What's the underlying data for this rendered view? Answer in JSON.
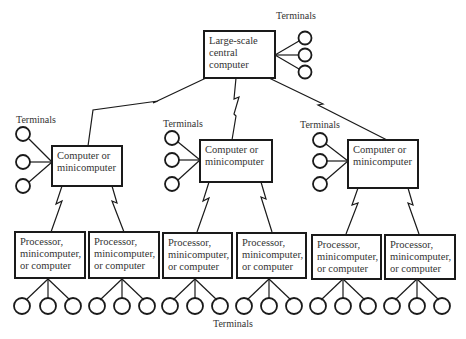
{
  "diagram": {
    "type": "hierarchical distributed processing network",
    "root": {
      "lines": [
        "Large-scale",
        "central",
        "computer"
      ],
      "terminals_label": "Terminals",
      "terminal_count": 3
    },
    "middle": [
      {
        "lines": [
          "Computer or",
          "minicomputer"
        ],
        "terminals_label": "Terminals",
        "terminal_count": 3
      },
      {
        "lines": [
          "Computer or",
          "minicomputer"
        ],
        "terminals_label": "Terminals",
        "terminal_count": 3
      },
      {
        "lines": [
          "Computer or",
          "minicomputer"
        ],
        "terminals_label": "Terminals",
        "terminal_count": 3
      }
    ],
    "leaves": [
      {
        "lines": [
          "Processor,",
          "minicomputer,",
          "or computer"
        ],
        "terminal_count": 3
      },
      {
        "lines": [
          "Processor,",
          "minicomputer,",
          "or computer"
        ],
        "terminal_count": 3
      },
      {
        "lines": [
          "Processor,",
          "minicomputer,",
          "or computer"
        ],
        "terminal_count": 3
      },
      {
        "lines": [
          "Processor,",
          "minicomputer,",
          "or computer"
        ],
        "terminal_count": 3
      },
      {
        "lines": [
          "Processor,",
          "minicomputer,",
          "or computer"
        ],
        "terminal_count": 3
      },
      {
        "lines": [
          "Processor,",
          "minicomputer,",
          "or computer"
        ],
        "terminal_count": 3
      }
    ],
    "bottom_terminals_label": "Terminals",
    "colors": {
      "stroke": "#1a1a1a",
      "text": "#333333",
      "background": "#ffffff"
    }
  }
}
